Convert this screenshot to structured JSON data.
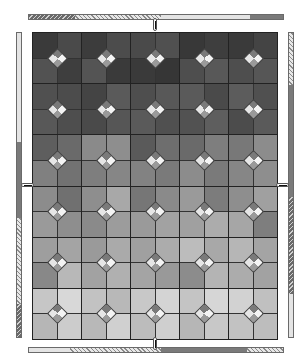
{
  "game": {
    "board": {
      "columns": 5,
      "rows": 6,
      "tiles": [
        [
          [
            "#3a3a3a",
            "#4a4a4a",
            "#525252",
            "#3e3e3e"
          ],
          [
            "#3c3c3c",
            "#4c4c4c",
            "#545454",
            "#3a3a3a"
          ],
          [
            "#4a4a4a",
            "#505050",
            "#3a3a3a",
            "#363636"
          ],
          [
            "#383838",
            "#3e3e3e",
            "#4e4e4e",
            "#585858"
          ],
          [
            "#3a3a3a",
            "#444444",
            "#4e4e4e",
            "#565656"
          ]
        ],
        [
          [
            "#505050",
            "#4c4c4c",
            "#585858",
            "#4e4e4e"
          ],
          [
            "#444444",
            "#5a5a5a",
            "#4a4a4a",
            "#565656"
          ],
          [
            "#4e4e4e",
            "#585858",
            "#5a5a5a",
            "#505050"
          ],
          [
            "#5a5a5a",
            "#4a4a4a",
            "#525252",
            "#5e5e5e"
          ],
          [
            "#5c5c5c",
            "#505050",
            "#4c4c4c",
            "#5a5a5a"
          ]
        ],
        [
          [
            "#5e5e5e",
            "#6a6a6a",
            "#808080",
            "#727272"
          ],
          [
            "#8a8a8a",
            "#8e8e8e",
            "#7e7e7e",
            "#868686"
          ],
          [
            "#5a5a5a",
            "#6e6e6e",
            "#828282",
            "#7a7a7a"
          ],
          [
            "#6a6a6a",
            "#7e7e7e",
            "#8c8c8c",
            "#7a7a7a"
          ],
          [
            "#787878",
            "#8c8c8c",
            "#868686",
            "#8e8e8e"
          ]
        ],
        [
          [
            "#8c8c8c",
            "#707070",
            "#9a9a9a",
            "#8e8e8e"
          ],
          [
            "#8e8e8e",
            "#a8a8a8",
            "#8a8a8a",
            "#9c9c9c"
          ],
          [
            "#767676",
            "#8a8a8a",
            "#9a9a9a",
            "#a2a2a2"
          ],
          [
            "#9a9a9a",
            "#7c7c7c",
            "#a0a0a0",
            "#acacac"
          ],
          [
            "#8e8e8e",
            "#a0a0a0",
            "#a6a6a6",
            "#7e7e7e"
          ]
        ],
        [
          [
            "#9e9e9e",
            "#a4a4a4",
            "#888888",
            "#b8b8b8"
          ],
          [
            "#9a9a9a",
            "#aaaaaa",
            "#a2a2a2",
            "#b0b0b0"
          ],
          [
            "#a0a0a0",
            "#acacac",
            "#a4a4a4",
            "#999999"
          ],
          [
            "#bcbcbc",
            "#a8a8a8",
            "#8c8c8c",
            "#b4b4b4"
          ],
          [
            "#b6b6b6",
            "#a4a4a4",
            "#acacac",
            "#a2a2a2"
          ]
        ],
        [
          [
            "#c6c6c6",
            "#d8d8d8",
            "#b6b6b6",
            "#cccccc"
          ],
          [
            "#c2c2c2",
            "#b8b8b8",
            "#b8b8b8",
            "#d0d0d0"
          ],
          [
            "#c8c8c8",
            "#d4d4d4",
            "#bcbcbc",
            "#cfcfcf"
          ],
          [
            "#c4c4c4",
            "#d6d6d6",
            "#b6b6b6",
            "#c8c8c8"
          ],
          [
            "#d2d2d2",
            "#c0c0c0",
            "#c2c2c2",
            "#bdbdbd"
          ]
        ]
      ]
    },
    "bars": {
      "top": [
        {
          "w": 18,
          "style": "dark"
        },
        {
          "w": 34,
          "style": "dots"
        },
        {
          "w": 35,
          "style": "light"
        },
        {
          "w": 13,
          "style": "mid"
        }
      ],
      "bottom": [
        {
          "w": 16,
          "style": "light"
        },
        {
          "w": 36,
          "style": "dots"
        },
        {
          "w": 34,
          "style": "mid"
        },
        {
          "w": 14,
          "style": "dots"
        }
      ],
      "left": [
        {
          "w": 36,
          "style": "light"
        },
        {
          "w": 25,
          "style": "mid"
        },
        {
          "w": 28,
          "style": "dots"
        },
        {
          "w": 11,
          "style": "dark"
        }
      ],
      "right": [
        {
          "w": 17,
          "style": "dots"
        },
        {
          "w": 37,
          "style": "mid"
        },
        {
          "w": 32,
          "style": "dark"
        },
        {
          "w": 14,
          "style": "light"
        }
      ]
    },
    "colors": {
      "bar_light": "#e4e4e4",
      "bar_mid": "#7a7a7a",
      "bar_border": "#6a6a6a",
      "grid_line": "#222222"
    }
  }
}
